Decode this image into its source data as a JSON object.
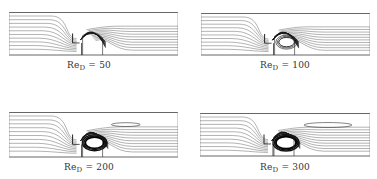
{
  "figure": {
    "line_color": "#555555",
    "background": "#ffffff",
    "panels": [
      {
        "id": "p1",
        "label_prefix": "Re",
        "label_sub": "D",
        "label_value": "= 50",
        "re": 50,
        "x": 9,
        "y": 12,
        "w": 169,
        "h": 43,
        "label_x": 89,
        "label_y": 68,
        "vortex": 0.25,
        "wake": 0
      },
      {
        "id": "p2",
        "label_prefix": "Re",
        "label_sub": "D",
        "label_value": "= 100",
        "re": 100,
        "x": 201,
        "y": 13,
        "w": 169,
        "h": 42,
        "label_x": 285,
        "label_y": 68,
        "vortex": 0.55,
        "wake": 0
      },
      {
        "id": "p3",
        "label_prefix": "Re",
        "label_sub": "D",
        "label_value": "= 200",
        "re": 200,
        "x": 9,
        "y": 112,
        "w": 169,
        "h": 45,
        "label_x": 89,
        "label_y": 170,
        "vortex": 0.85,
        "wake": 0.4
      },
      {
        "id": "p4",
        "label_prefix": "Re",
        "label_sub": "D",
        "label_value": "= 300",
        "re": 300,
        "x": 200,
        "y": 113,
        "w": 170,
        "h": 43,
        "label_x": 285,
        "label_y": 170,
        "vortex": 1.0,
        "wake": 1.0
      }
    ]
  }
}
